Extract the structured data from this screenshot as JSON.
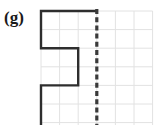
{
  "figure": {
    "panel_label": "(g)",
    "background_color": "#ffffff"
  },
  "grid": {
    "line_color": "#e2e2e2",
    "line_width": 1,
    "cell_size": 18.6,
    "x_start": 41,
    "y_start": 11,
    "columns": 6,
    "rows": 6,
    "x_lines": [
      41,
      59.6,
      78.2,
      96.8,
      115.4,
      134,
      152.6
    ],
    "y_lines": [
      11,
      29.6,
      48.2,
      66.8,
      85.4,
      104,
      122.6
    ]
  },
  "shape": {
    "name": "step-polyline",
    "stroke_color": "#2e2e2e",
    "stroke_width": 2.4,
    "points": "41,125 41,85.4 78.2,85.4 78.2,48.2 41,48.2 41,11 96.8,11",
    "segments": [
      {
        "name": "lower-left-vertical",
        "x1": 41,
        "y1": 125,
        "x2": 41,
        "y2": 85.4
      },
      {
        "name": "lower-horizontal",
        "x1": 41,
        "y1": 85.4,
        "x2": 78.2,
        "y2": 85.4
      },
      {
        "name": "middle-vertical",
        "x1": 78.2,
        "y1": 85.4,
        "x2": 78.2,
        "y2": 48.2
      },
      {
        "name": "middle-horizontal",
        "x1": 78.2,
        "y1": 48.2,
        "x2": 41,
        "y2": 48.2
      },
      {
        "name": "upper-left-vertical",
        "x1": 41,
        "y1": 48.2,
        "x2": 41,
        "y2": 11
      },
      {
        "name": "top-horizontal",
        "x1": 41,
        "y1": 11,
        "x2": 96.8,
        "y2": 11
      }
    ]
  },
  "mirror_line": {
    "name": "dashed-vertical-axis",
    "stroke_color": "#3a3a3a",
    "stroke_width": 3.2,
    "dash_pattern": "5 3.2",
    "x": 96.8,
    "y_top": 9,
    "y_bottom": 125
  }
}
